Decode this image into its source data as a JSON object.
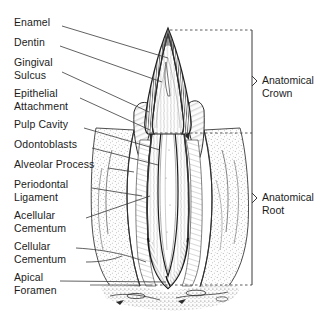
{
  "figure": {
    "kind": "anatomical-diagram",
    "background": "#ffffff",
    "ink": "#1b1b1b",
    "line_color": "#3a3a3a"
  },
  "left_labels": [
    {
      "text": "Enamel",
      "x": 14,
      "y": 22,
      "lines": 1
    },
    {
      "text": "Dentin",
      "x": 14,
      "y": 42,
      "lines": 1
    },
    {
      "text": "Gingival\nSulcus",
      "x": 14,
      "y": 62,
      "lines": 2
    },
    {
      "text": "Epithelial\nAttachment",
      "x": 14,
      "y": 93,
      "lines": 2
    },
    {
      "text": "Pulp Cavity",
      "x": 14,
      "y": 124,
      "lines": 1
    },
    {
      "text": "Odontoblasts",
      "x": 14,
      "y": 144,
      "lines": 1
    },
    {
      "text": "Alveolar Process",
      "x": 14,
      "y": 164,
      "lines": 1
    },
    {
      "text": "Periodontal\nLigament",
      "x": 14,
      "y": 184,
      "lines": 2
    },
    {
      "text": "Acellular\nCementum",
      "x": 14,
      "y": 215,
      "lines": 2
    },
    {
      "text": "Cellular\nCementum",
      "x": 14,
      "y": 245,
      "lines": 2
    },
    {
      "text": "Apical\nForamen",
      "x": 14,
      "y": 277,
      "lines": 2
    }
  ],
  "right_labels": [
    {
      "text": "Anatomical\nCrown",
      "x": 262,
      "y": 78,
      "brace_top": 30,
      "brace_bottom": 133
    },
    {
      "text": "Anatomical\nRoot",
      "x": 262,
      "y": 195,
      "brace_top": 133,
      "brace_bottom": 285
    }
  ],
  "reference_lines": {
    "style": "dashed",
    "incisal_y": 30,
    "cementoenamel_junction_y": 133,
    "apex_y": 285,
    "bracket_x": 252
  },
  "structures": [
    "enamel cap (hatched)",
    "dentin",
    "gingival sulcus",
    "epithelial attachment",
    "pulp cavity",
    "odontoblast layer",
    "alveolar process (stippled bone)",
    "periodontal ligament",
    "acellular cementum",
    "cellular cementum",
    "apical foramen"
  ]
}
